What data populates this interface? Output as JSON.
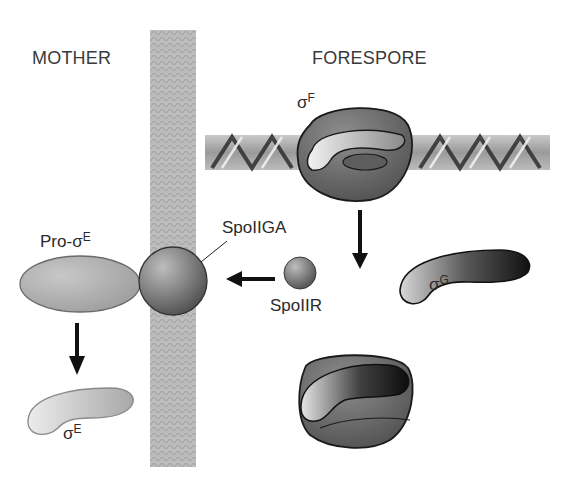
{
  "regions": {
    "mother": "MOTHER",
    "forespore": "FORESPORE"
  },
  "proteins": {
    "pro_sigma_e": {
      "prefix": "Pro-",
      "symbol": "σ",
      "superscript": "E"
    },
    "sigma_e": {
      "symbol": "σ",
      "superscript": "E"
    },
    "sigma_f": {
      "symbol": "σ",
      "superscript": "F"
    },
    "sigma_g": {
      "symbol": "σ",
      "superscript": "G"
    },
    "spoiiga": "SpoIIGA",
    "spoiir": "SpoIIR"
  },
  "colors": {
    "background": "#ffffff",
    "membrane": "#b8b8b8",
    "dna": "#a9a9a9",
    "rna_polymerase": "#6f6f6f",
    "pro_sigma_e_fill": "#ababab",
    "sigma_e_fill": "#c4c4c4",
    "sigma_g_dark": "#1c1c1c",
    "sphere": "#808080",
    "arrow": "#111111",
    "text": "#2a2a2a"
  }
}
